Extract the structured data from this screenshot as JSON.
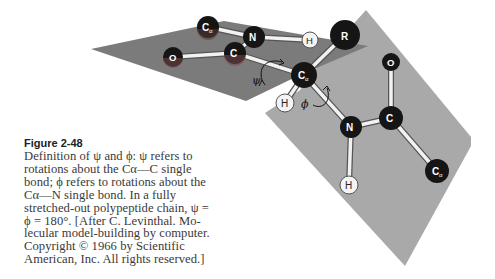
{
  "figure": {
    "number": "Figure 2-48",
    "caption_lines": [
      "Definition of ψ and ϕ: ψ refers to",
      "rotations about the Cα—C single",
      "bond; ϕ refers to rotations about the",
      "Cα—N single bond. In a fully",
      "stretched-out polypeptide chain, ψ =",
      "ϕ = 180°. [After C. Levinthal. Mo-",
      "lecular model-building by computer.",
      "Copyright © 1966 by Scientific",
      "American, Inc. All rights reserved.]"
    ]
  },
  "diagram": {
    "colors": {
      "left_plane": "#7b7b7b",
      "right_plane": "#a9a9a9",
      "atom_dark": "#151515",
      "atom_light": "#f4f4f4",
      "bond": "#f2f2f2"
    },
    "angle_labels": {
      "psi": "ψ",
      "phi": "ϕ"
    },
    "atoms": [
      {
        "id": "ca1",
        "label": "C",
        "sub": "α",
        "type": "dark"
      },
      {
        "id": "n1",
        "label": "N",
        "type": "dark"
      },
      {
        "id": "o1",
        "label": "O",
        "type": "dark"
      },
      {
        "id": "c1",
        "label": "C",
        "type": "dark"
      },
      {
        "id": "h1",
        "label": "H",
        "type": "light"
      },
      {
        "id": "r",
        "label": "R",
        "type": "dark"
      },
      {
        "id": "ca2",
        "label": "C",
        "sub": "α",
        "type": "dark"
      },
      {
        "id": "h2",
        "label": "H",
        "type": "light"
      },
      {
        "id": "n2",
        "label": "N",
        "type": "dark"
      },
      {
        "id": "o2",
        "label": "O",
        "type": "dark"
      },
      {
        "id": "c2",
        "label": "C",
        "type": "dark"
      },
      {
        "id": "h3",
        "label": "H",
        "type": "light"
      },
      {
        "id": "ca3",
        "label": "C",
        "sub": "α",
        "type": "dark"
      }
    ]
  }
}
